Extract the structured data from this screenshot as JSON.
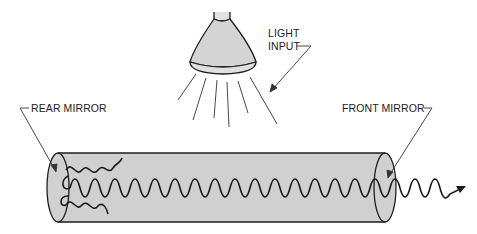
{
  "diagram": {
    "colors": {
      "ink": "#1e1e1e",
      "tube_fill": "#d0d0d0",
      "lamp_fill": "#d4d4d4",
      "background": "#ffffff"
    },
    "labels": {
      "light_input_line1": "LIGHT",
      "light_input_line2": "INPUT",
      "rear_mirror": "REAR MIRROR",
      "front_mirror": "FRONT MIRROR"
    },
    "components": [
      {
        "id": "lamp",
        "name": "Light source lamp"
      },
      {
        "id": "light-rays",
        "name": "Light rays",
        "count": 6
      },
      {
        "id": "tube",
        "name": "Laser medium tube"
      },
      {
        "id": "rear-mirror",
        "name": "Rear mirror"
      },
      {
        "id": "front-mirror",
        "name": "Front mirror"
      },
      {
        "id": "wave",
        "name": "Standing light wave / output beam"
      }
    ]
  }
}
